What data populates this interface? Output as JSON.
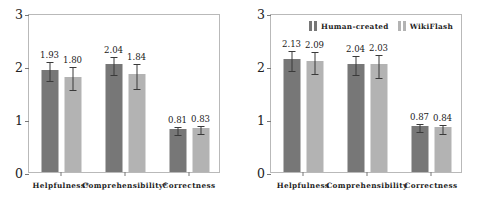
{
  "chart_data": [
    {
      "type": "bar",
      "panel": "left",
      "title": "",
      "xlabel": "",
      "ylabel": "",
      "ylim": [
        0,
        3
      ],
      "yticks": [
        0,
        1,
        2,
        3
      ],
      "ytick_labels": [
        "0",
        "1",
        "2",
        "3"
      ],
      "grid": false,
      "legend": null,
      "categories": [
        "Helpfulness*",
        "Comprehensibility*",
        "Correctness"
      ],
      "series": [
        {
          "name": "Human-created",
          "color": "#777777",
          "values": [
            1.93,
            2.04,
            0.81
          ],
          "value_labels": [
            "1.93",
            "2.04",
            "0.81"
          ],
          "errors": [
            0.18,
            0.17,
            0.07
          ]
        },
        {
          "name": "WikiFlash",
          "color": "#b3b3b3",
          "values": [
            1.8,
            1.84,
            0.83
          ],
          "value_labels": [
            "1.80",
            "1.84",
            "0.83"
          ],
          "errors": [
            0.22,
            0.23,
            0.07
          ]
        }
      ]
    },
    {
      "type": "bar",
      "panel": "right",
      "title": "",
      "xlabel": "",
      "ylabel": "",
      "ylim": [
        0,
        3
      ],
      "yticks": [
        0,
        1,
        2,
        3
      ],
      "ytick_labels": [
        "0",
        "1",
        "2",
        "3"
      ],
      "grid": false,
      "legend": {
        "position": "top-center",
        "entries": [
          {
            "label": "Human-created",
            "color": "#777777"
          },
          {
            "label": "WikiFlash",
            "color": "#b3b3b3"
          }
        ]
      },
      "categories": [
        "Helpfulness",
        "Comprehensibility",
        "Correctness"
      ],
      "series": [
        {
          "name": "Human-created",
          "color": "#777777",
          "values": [
            2.13,
            2.04,
            0.87
          ],
          "value_labels": [
            "2.13",
            "2.04",
            "0.87"
          ],
          "errors": [
            0.19,
            0.18,
            0.07
          ]
        },
        {
          "name": "WikiFlash",
          "color": "#b3b3b3",
          "values": [
            2.09,
            2.03,
            0.84
          ],
          "value_labels": [
            "2.09",
            "2.03",
            "0.84"
          ],
          "errors": [
            0.21,
            0.22,
            0.08
          ]
        }
      ]
    }
  ]
}
